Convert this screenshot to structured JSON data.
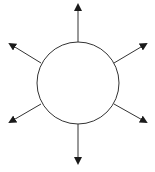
{
  "diagram": {
    "type": "radial-arrows",
    "center": {
      "x": 78,
      "y": 83,
      "r": 41
    },
    "stroke_color": "#333333",
    "arrowhead_color": "#1a1a1a",
    "fill": "#ffffff",
    "arrows": [
      {
        "name": "up",
        "x1": 78,
        "y1": 42,
        "x2": 78,
        "y2": 5
      },
      {
        "name": "upper-right",
        "x1": 114,
        "y1": 63,
        "x2": 146,
        "y2": 44
      },
      {
        "name": "lower-right",
        "x1": 114,
        "y1": 104,
        "x2": 146,
        "y2": 122
      },
      {
        "name": "down",
        "x1": 78,
        "y1": 124,
        "x2": 78,
        "y2": 163
      },
      {
        "name": "lower-left",
        "x1": 41,
        "y1": 104,
        "x2": 10,
        "y2": 122
      },
      {
        "name": "upper-left",
        "x1": 41,
        "y1": 63,
        "x2": 10,
        "y2": 44
      }
    ]
  }
}
